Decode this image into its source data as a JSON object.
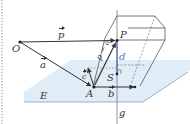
{
  "diagram": {
    "type": "vector-geometry-distance-point-plane",
    "colors": {
      "plane_fill": "#dbe9f5",
      "plane_edge": "#8fb3d6",
      "line": "#444444",
      "dashed": "#777777",
      "distance": "#4a6fc0",
      "left_border": "#9aa0a6"
    },
    "points": {
      "O": "O",
      "P": "P",
      "A": "A",
      "S": "S"
    },
    "vectors": {
      "p": "p",
      "a": "a",
      "p_minus_a": "p − a",
      "c": "c",
      "b": "b"
    },
    "labels": {
      "plane": "E",
      "line": "g",
      "distance": "d"
    }
  }
}
